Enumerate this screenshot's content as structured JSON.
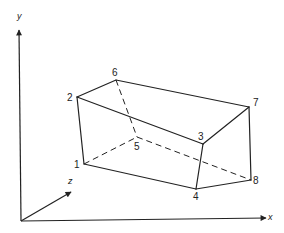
{
  "diagram": {
    "type": "3d-box-wireframe",
    "axes": [
      {
        "name": "y",
        "label": "y",
        "from": [
          21,
          221
        ],
        "to": [
          19,
          30
        ],
        "label_pos": [
          17,
          19
        ]
      },
      {
        "name": "x",
        "label": "x",
        "from": [
          21,
          221
        ],
        "to": [
          266,
          218
        ],
        "label_pos": [
          268,
          220
        ]
      },
      {
        "name": "z",
        "label": "z",
        "from": [
          21,
          221
        ],
        "to": [
          71,
          192
        ],
        "label_pos": [
          68,
          184
        ]
      }
    ],
    "vertices": [
      {
        "id": "1",
        "label": "1",
        "pos": [
          84,
          164
        ],
        "label_pos": [
          74,
          168
        ]
      },
      {
        "id": "2",
        "label": "2",
        "pos": [
          77,
          97
        ],
        "label_pos": [
          67,
          101
        ]
      },
      {
        "id": "3",
        "label": "3",
        "pos": [
          203,
          144
        ],
        "label_pos": [
          198,
          140
        ]
      },
      {
        "id": "4",
        "label": "4",
        "pos": [
          196,
          189
        ],
        "label_pos": [
          193,
          200
        ]
      },
      {
        "id": "5",
        "label": "5",
        "pos": [
          137,
          137
        ],
        "label_pos": [
          134,
          150
        ]
      },
      {
        "id": "6",
        "label": "6",
        "pos": [
          116,
          80
        ],
        "label_pos": [
          112,
          76
        ]
      },
      {
        "id": "7",
        "label": "7",
        "pos": [
          249,
          107
        ],
        "label_pos": [
          253,
          106
        ]
      },
      {
        "id": "8",
        "label": "8",
        "pos": [
          251,
          180
        ],
        "label_pos": [
          253,
          184
        ]
      }
    ],
    "solid_edges": [
      [
        "1",
        "2"
      ],
      [
        "2",
        "6"
      ],
      [
        "6",
        "7"
      ],
      [
        "2",
        "3"
      ],
      [
        "3",
        "7"
      ],
      [
        "3",
        "4"
      ],
      [
        "1",
        "4"
      ],
      [
        "4",
        "8"
      ],
      [
        "7",
        "8"
      ]
    ],
    "hidden_edges": [
      [
        "6",
        "5"
      ],
      [
        "1",
        "5"
      ],
      [
        "5",
        "8"
      ]
    ]
  }
}
